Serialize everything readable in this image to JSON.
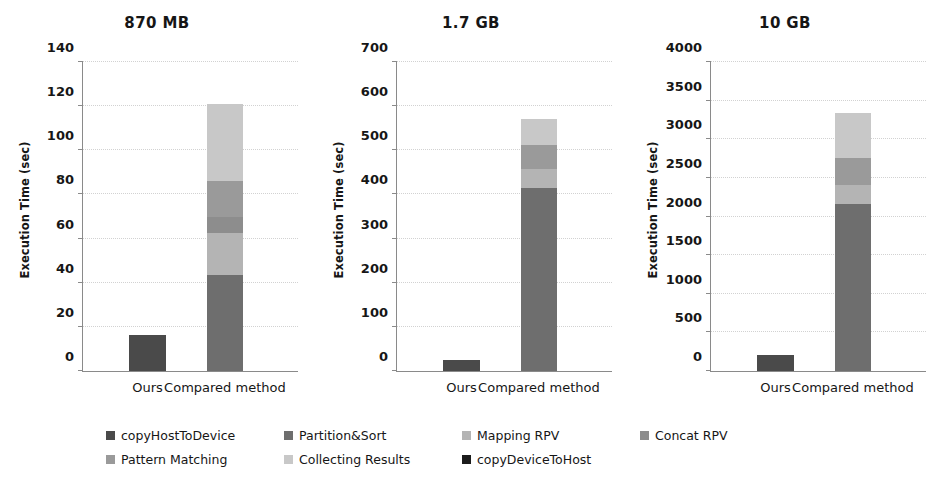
{
  "chart_data": {
    "type": "bar",
    "subtype": "stacked-bar",
    "title": "",
    "panel_layout": "1x3",
    "xlabel": "",
    "ylabel": "Execution Time (sec)",
    "grid": true,
    "legend_position": "bottom",
    "categories": [
      "Ours",
      "Compared method"
    ],
    "series_names": [
      "copyHostToDevice",
      "Partition&Sort",
      "Mapping RPV",
      "Concat RPV",
      "Pattern Matching",
      "Collecting Results",
      "copyDeviceToHost"
    ],
    "series_colors": [
      "#4a4a4a",
      "#6e6e6e",
      "#a8a8a8",
      "#8d8d8d",
      "#9a9a9a",
      "#c4c4c4",
      "#1c1c1c"
    ],
    "panels": [
      {
        "title": "870 MB",
        "ylabel": "Execution Time (sec)",
        "ylim": [
          0,
          140
        ],
        "yticks": [
          0,
          20,
          40,
          60,
          80,
          100,
          120,
          140
        ],
        "categories": [
          "Ours",
          "Compared method"
        ],
        "series": [
          {
            "name": "copyHostToDevice",
            "values": [
              16.3,
              0
            ]
          },
          {
            "name": "Partition&Sort",
            "values": [
              0,
              43.5
            ]
          },
          {
            "name": "Mapping RPV",
            "values": [
              0,
              19.0
            ]
          },
          {
            "name": "Concat RPV",
            "values": [
              0,
              7.5
            ]
          },
          {
            "name": "Pattern Matching",
            "values": [
              0,
              16.0
            ]
          },
          {
            "name": "Collecting Results",
            "values": [
              0,
              35.2
            ]
          },
          {
            "name": "copyDeviceToHost",
            "values": [
              0,
              0
            ]
          }
        ],
        "totals": [
          16.3,
          121.2
        ]
      },
      {
        "title": "1.7 GB",
        "ylabel": "Execution Time (sec)",
        "ylim": [
          0,
          700
        ],
        "yticks": [
          0,
          100,
          200,
          300,
          400,
          500,
          600,
          700
        ],
        "categories": [
          "Ours",
          "Compared method"
        ],
        "series": [
          {
            "name": "copyHostToDevice",
            "values": [
              25.0,
              0
            ]
          },
          {
            "name": "Partition&Sort",
            "values": [
              0,
              415.0
            ]
          },
          {
            "name": "Mapping RPV",
            "values": [
              0,
              43.0
            ]
          },
          {
            "name": "Concat RPV",
            "values": [
              0,
              0
            ]
          },
          {
            "name": "Pattern Matching",
            "values": [
              0,
              55.0
            ]
          },
          {
            "name": "Collecting Results",
            "values": [
              0,
              57.0
            ]
          },
          {
            "name": "copyDeviceToHost",
            "values": [
              0,
              0
            ]
          }
        ],
        "totals": [
          25.0,
          570.0
        ]
      },
      {
        "title": "10 GB",
        "ylabel": "Execution Time (sec)",
        "ylim": [
          0,
          4000
        ],
        "yticks": [
          0,
          500,
          1000,
          1500,
          2000,
          2500,
          3000,
          3500,
          4000
        ],
        "categories": [
          "Ours",
          "Compared method"
        ],
        "series": [
          {
            "name": "copyHostToDevice",
            "values": [
              205,
              0
            ]
          },
          {
            "name": "Partition&Sort",
            "values": [
              0,
              2160
            ]
          },
          {
            "name": "Mapping RPV",
            "values": [
              0,
              250
            ]
          },
          {
            "name": "Concat RPV",
            "values": [
              0,
              0
            ]
          },
          {
            "name": "Pattern Matching",
            "values": [
              0,
              345
            ]
          },
          {
            "name": "Collecting Results",
            "values": [
              0,
              590
            ]
          },
          {
            "name": "copyDeviceToHost",
            "values": [
              0,
              0
            ]
          }
        ],
        "totals": [
          205,
          3345
        ]
      }
    ],
    "legend": [
      {
        "label": "copyHostToDevice",
        "color": "#4a4a4a"
      },
      {
        "label": "Partition&Sort",
        "color": "#6e6e6e"
      },
      {
        "label": "Mapping RPV",
        "color": "#b4b4b4"
      },
      {
        "label": "Concat RPV",
        "color": "#8d8d8d"
      },
      {
        "label": "Pattern Matching",
        "color": "#9a9a9a"
      },
      {
        "label": "Collecting Results",
        "color": "#c8c8c8"
      },
      {
        "label": "copyDeviceToHost",
        "color": "#1c1c1c"
      }
    ]
  }
}
